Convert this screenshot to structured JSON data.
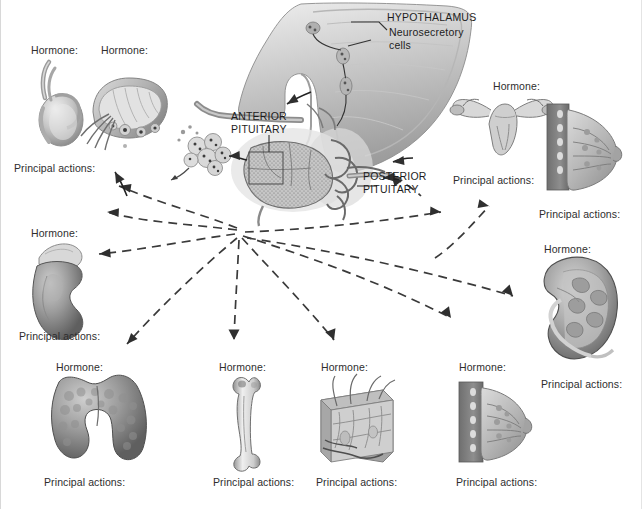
{
  "diagram": {
    "central_labels": [
      {
        "id": "hypothalamus",
        "text": "HYPOTHALAMUS"
      },
      {
        "id": "neurosecretory-cells",
        "text": "Neurosecretory\ncells"
      },
      {
        "id": "anterior-pituitary",
        "text": "ANTERIOR\nPITUITARY"
      },
      {
        "id": "posterior-pituitary",
        "text": "POSTERIOR\nPITUITARY"
      }
    ],
    "targets": [
      {
        "id": "testis",
        "organ": "testis-illustration",
        "hormone_label": "Hormone:",
        "actions_label": "Principal actions:",
        "hormone_x": 30,
        "hormone_y": 44,
        "actions_x": 13,
        "actions_y": 162
      },
      {
        "id": "ovary-follicle",
        "organ": "ovary-follicle-illustration",
        "hormone_label": "Hormone:",
        "actions_label": "",
        "hormone_x": 100,
        "hormone_y": 44,
        "actions_x": 0,
        "actions_y": 0
      },
      {
        "id": "adrenal-kidney",
        "organ": "adrenal-gland-kidney-illustration",
        "hormone_label": "Hormone:",
        "actions_label": "Principal actions:",
        "hormone_x": 30,
        "hormone_y": 227,
        "actions_x": 18,
        "actions_y": 330
      },
      {
        "id": "thyroid",
        "organ": "thyroid-gland-illustration",
        "hormone_label": "Hormone:",
        "actions_label": "Principal actions:",
        "hormone_x": 55,
        "hormone_y": 361,
        "actions_x": 43,
        "actions_y": 476
      },
      {
        "id": "bone",
        "organ": "long-bone-illustration",
        "hormone_label": "Hormone:",
        "actions_label": "Principal actions:",
        "hormone_x": 218,
        "hormone_y": 361,
        "actions_x": 212,
        "actions_y": 476
      },
      {
        "id": "skin",
        "organ": "skin-section-illustration",
        "hormone_label": "Hormone:",
        "actions_label": "Principal actions:",
        "hormone_x": 320,
        "hormone_y": 361,
        "actions_x": 315,
        "actions_y": 476
      },
      {
        "id": "mammary-lower",
        "organ": "breast-section-illustration",
        "hormone_label": "Hormone:",
        "actions_label": "Principal actions:",
        "hormone_x": 458,
        "hormone_y": 361,
        "actions_x": 455,
        "actions_y": 476
      },
      {
        "id": "uterus-ovaries",
        "organ": "uterus-ovaries-illustration",
        "hormone_label": "Hormone:",
        "actions_label": "Principal actions:",
        "hormone_x": 492,
        "hormone_y": 80,
        "actions_x": 452,
        "actions_y": 174
      },
      {
        "id": "mammary-upper",
        "organ": "breast-section-illustration",
        "hormone_label": "",
        "actions_label": "Principal actions:",
        "hormone_x": 0,
        "hormone_y": 0,
        "actions_x": 538,
        "actions_y": 208
      },
      {
        "id": "kidney-right",
        "organ": "kidney-section-illustration",
        "hormone_label": "Hormone:",
        "actions_label": "Principal actions:",
        "hormone_x": 543,
        "hormone_y": 243,
        "actions_x": 540,
        "actions_y": 378
      }
    ],
    "colors": {
      "ink": "#2e2e2e",
      "arrow": "#3a3a3a",
      "organ_mid": "#9a9a9a",
      "organ_dark": "#646464",
      "organ_light": "#d2d2d2",
      "background": "#ffffff"
    }
  }
}
